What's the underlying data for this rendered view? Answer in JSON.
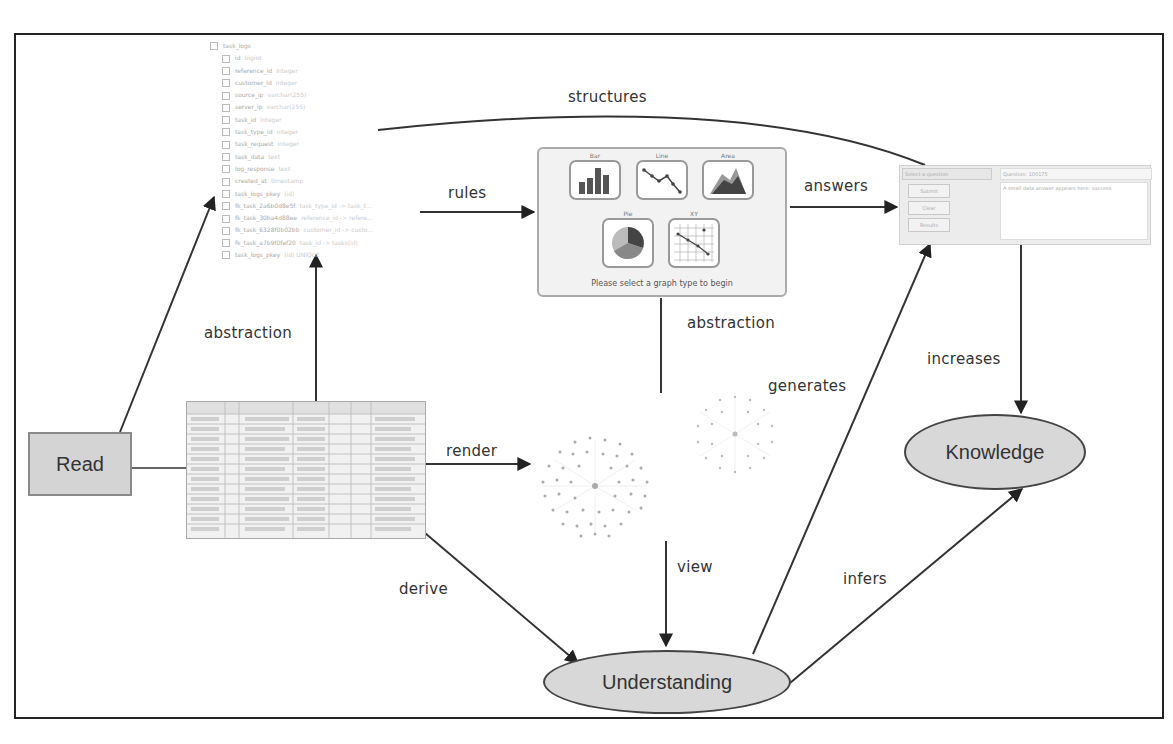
{
  "diagram": {
    "nodes": {
      "read": {
        "label": "Read"
      },
      "understanding": {
        "label": "Understanding"
      },
      "knowledge": {
        "label": "Knowledge"
      }
    },
    "edge_labels": {
      "structures": "structures",
      "rules": "rules",
      "answers": "answers",
      "abstraction_left": "abstraction",
      "abstraction_mid": "abstraction",
      "generates": "generates",
      "increases": "increases",
      "render": "render",
      "derive": "derive",
      "view": "view",
      "infers": "infers"
    },
    "edges": [
      {
        "from": "read",
        "to": "schema-tree"
      },
      {
        "from": "read",
        "to": "data-table"
      },
      {
        "from": "data-table",
        "to": "schema-tree",
        "label": "abstraction"
      },
      {
        "from": "schema-tree",
        "to": "chart-type-selector",
        "label": "rules"
      },
      {
        "from": "schema-tree",
        "to": "qa-panel",
        "label": "structures"
      },
      {
        "from": "chart-type-selector",
        "to": "qa-panel",
        "label": "answers"
      },
      {
        "from": "chart-type-selector",
        "to": "graph-views",
        "label": "abstraction"
      },
      {
        "from": "data-table",
        "to": "graph-views",
        "label": "render"
      },
      {
        "from": "data-table",
        "to": "understanding",
        "label": "derive"
      },
      {
        "from": "graph-views",
        "to": "understanding",
        "label": "view"
      },
      {
        "from": "understanding",
        "to": "qa-panel",
        "label": "generates"
      },
      {
        "from": "understanding",
        "to": "knowledge",
        "label": "infers"
      },
      {
        "from": "qa-panel",
        "to": "knowledge",
        "label": "increases"
      }
    ]
  },
  "schema_tree": {
    "root": "task_logs",
    "fields": [
      {
        "name": "id",
        "type": "bigint"
      },
      {
        "name": "reference_id",
        "type": "integer"
      },
      {
        "name": "customer_id",
        "type": "integer"
      },
      {
        "name": "source_ip",
        "type": "varchar(255)"
      },
      {
        "name": "server_ip",
        "type": "varchar(255)"
      },
      {
        "name": "task_id",
        "type": "integer"
      },
      {
        "name": "task_type_id",
        "type": "integer"
      },
      {
        "name": "task_request",
        "type": "integer"
      },
      {
        "name": "task_data",
        "type": "text"
      },
      {
        "name": "log_response",
        "type": "text"
      },
      {
        "name": "created_at",
        "type": "timestamp"
      },
      {
        "name": "task_logs_pkey",
        "type": "(id)"
      },
      {
        "name": "fk_task_2a6b0d8e5f",
        "type": "task_type_id -> task_t..."
      },
      {
        "name": "fk_task_30ba4d88ee",
        "type": "reference_id -> refere..."
      },
      {
        "name": "fk_task_6328f0b02bb",
        "type": "customer_id -> custo..."
      },
      {
        "name": "fk_task_a7b9f0fef20",
        "type": "task_id -> tasks(id)"
      },
      {
        "name": "task_logs_pkey",
        "type": "(id) UNIQUE"
      }
    ]
  },
  "chart_selector": {
    "types": [
      "Bar",
      "Line",
      "Area",
      "Pie",
      "XY"
    ],
    "caption": "Please select a graph type to begin"
  },
  "qa_panel": {
    "select_value": "Select a question",
    "buttons": [
      "Submit",
      "Clear",
      "Results"
    ],
    "question": "Question: 100175",
    "answer": "A small data answer appears here: success"
  }
}
